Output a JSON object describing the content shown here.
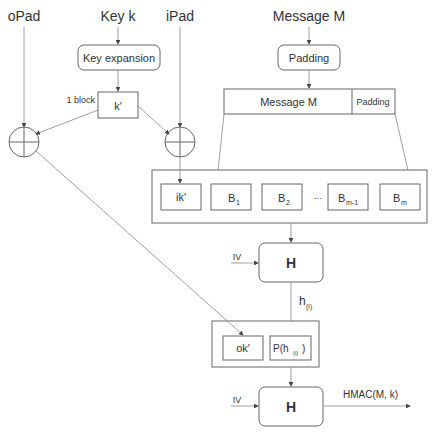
{
  "inputs": {
    "opad": "oPad",
    "key": "Key k",
    "ipad": "iPad",
    "message": "Message M"
  },
  "boxes": {
    "key_expansion": "Key expansion",
    "kprime": "k′",
    "block_note": "1 block",
    "padding": "Padding",
    "message_bar_message": "Message M",
    "message_bar_padding": "Padding",
    "ik": "ik′",
    "b1": "B",
    "b1_sub": "1",
    "b2": "B",
    "b2_sub": "2",
    "ellipsis": "…",
    "bm1": "B",
    "bm1_sub": "m-1",
    "bm": "B",
    "bm_sub": "m",
    "hash1": "H",
    "iv1": "IV",
    "hi": "h",
    "hi_sub": "(i)",
    "ok": "ok′",
    "phi": "P(h",
    "phi_sub": "(i)",
    "phi_close": ")",
    "hash2": "H",
    "iv2": "IV",
    "output": "HMAC(M, k)"
  }
}
